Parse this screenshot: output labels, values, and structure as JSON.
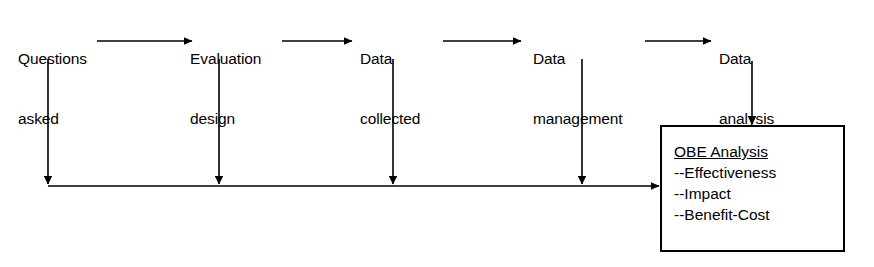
{
  "diagram": {
    "stroke_color": "#000000",
    "background_color": "#ffffff",
    "nodes": [
      {
        "id": "questions",
        "line1": "Questions",
        "line2": "asked"
      },
      {
        "id": "evaluation",
        "line1": "Evaluation",
        "line2": "design"
      },
      {
        "id": "collected",
        "line1": "Data",
        "line2": "collected"
      },
      {
        "id": "management",
        "line1": "Data",
        "line2": "management"
      },
      {
        "id": "analysis",
        "line1": "Data",
        "line2": "analysis"
      }
    ],
    "result_box": {
      "title": "OBE Analysis",
      "items": [
        "--Effectiveness",
        "--Impact",
        "--Benefit-Cost"
      ]
    },
    "connectors": {
      "horizontal_arrows": 4,
      "drop_arrows": 4,
      "collector_arrow": 1,
      "analysis_to_box_arrow": 1
    }
  }
}
